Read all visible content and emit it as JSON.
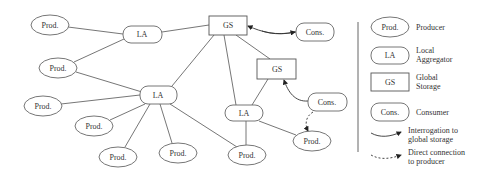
{
  "diagram": {
    "nodes": [
      {
        "id": "prod1",
        "type": "producer",
        "label": "Prod.",
        "cx": 50,
        "cy": 25
      },
      {
        "id": "prod2",
        "type": "producer",
        "label": "Prod.",
        "cx": 58,
        "cy": 68
      },
      {
        "id": "prod3",
        "type": "producer",
        "label": "Prod.",
        "cx": 43,
        "cy": 106
      },
      {
        "id": "prod4",
        "type": "producer",
        "label": "Prod.",
        "cx": 94,
        "cy": 126
      },
      {
        "id": "prod5",
        "type": "producer",
        "label": "Prod.",
        "cx": 118,
        "cy": 157
      },
      {
        "id": "prod6",
        "type": "producer",
        "label": "Prod.",
        "cx": 178,
        "cy": 153
      },
      {
        "id": "prod7",
        "type": "producer",
        "label": "Prod.",
        "cx": 247,
        "cy": 155
      },
      {
        "id": "prod8",
        "type": "producer",
        "label": "Prod.",
        "cx": 312,
        "cy": 141
      },
      {
        "id": "la1",
        "type": "local-aggregator",
        "label": "LA",
        "cx": 142,
        "cy": 34
      },
      {
        "id": "la2",
        "type": "local-aggregator",
        "label": "LA",
        "cx": 158,
        "cy": 95
      },
      {
        "id": "la3",
        "type": "local-aggregator",
        "label": "LA",
        "cx": 244,
        "cy": 113
      },
      {
        "id": "gs1",
        "type": "global-storage",
        "label": "GS",
        "cx": 228,
        "cy": 25
      },
      {
        "id": "gs2",
        "type": "global-storage",
        "label": "GS",
        "cx": 277,
        "cy": 69
      },
      {
        "id": "cons1",
        "type": "consumer",
        "label": "Cons.",
        "cx": 315,
        "cy": 32
      },
      {
        "id": "cons2",
        "type": "consumer",
        "label": "Cons.",
        "cx": 327,
        "cy": 102
      }
    ],
    "edges": [
      [
        "prod1",
        "la1"
      ],
      [
        "prod2",
        "la1"
      ],
      [
        "la1",
        "gs1"
      ],
      [
        "prod2",
        "la2"
      ],
      [
        "prod3",
        "la2"
      ],
      [
        "prod4",
        "la2"
      ],
      [
        "prod5",
        "la2"
      ],
      [
        "prod6",
        "la2"
      ],
      [
        "prod7",
        "la2"
      ],
      [
        "la2",
        "gs1"
      ],
      [
        "gs1",
        "la3"
      ],
      [
        "gs1",
        "gs2"
      ],
      [
        "gs2",
        "la3"
      ],
      [
        "la3",
        "prod7"
      ],
      [
        "la3",
        "prod8"
      ]
    ],
    "interrogation_arrows": [
      [
        "cons1",
        "gs1"
      ],
      [
        "cons2",
        "gs2"
      ]
    ],
    "direct_arrows": [
      [
        "cons2",
        "prod8"
      ]
    ]
  },
  "legend": {
    "items": [
      {
        "symbol": "ellipse",
        "symbol_label": "Prod.",
        "text": [
          "Producer"
        ]
      },
      {
        "symbol": "rounded-rect",
        "symbol_label": "LA",
        "text": [
          "Local",
          "Aggregator"
        ]
      },
      {
        "symbol": "rect",
        "symbol_label": "GS",
        "text": [
          "Global",
          "Storage"
        ]
      },
      {
        "symbol": "rounded-rect",
        "symbol_label": "Cons.",
        "text": [
          "Consumer"
        ]
      },
      {
        "symbol": "solid-arrow",
        "text": [
          "Interrogation to",
          "global storage"
        ]
      },
      {
        "symbol": "dashed-arrow",
        "text": [
          "Direct connection",
          "to producer"
        ]
      }
    ]
  },
  "colors": {
    "stroke": "#555555",
    "text": "#333333",
    "background": "#ffffff"
  }
}
